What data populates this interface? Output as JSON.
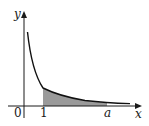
{
  "figure": {
    "axes": {
      "x_label": "x",
      "y_label": "y",
      "origin_label": "0"
    },
    "ticks": {
      "one": "1",
      "a": "a"
    },
    "colors": {
      "axis": "#1a1a1a",
      "curve": "#111111",
      "shade": "#9a9a9a"
    }
  }
}
